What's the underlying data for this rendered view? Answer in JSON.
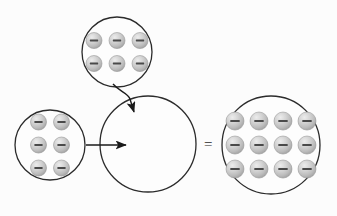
{
  "canvas": {
    "width": 337,
    "height": 216,
    "background_color": "#fcfcfc"
  },
  "style": {
    "circle_stroke_color": "#2b2b2b",
    "circle_stroke_width": 1.3,
    "circle_fill_color": "#fdfdfd",
    "arrow_color": "#1a1a1a",
    "particle_fill_light": "#e2e2e2",
    "particle_fill_mid": "#c3c3c3",
    "particle_fill_dark": "#a9a9a9",
    "particle_stroke_color": "#9a9a9a",
    "particle_sign_color": "#4a4a4a",
    "equals_color": "#2b2b2b"
  },
  "diagram": {
    "title": "",
    "equation_operator": "=",
    "particle_symbol": "−",
    "particle_name": "electron",
    "groups": [
      {
        "id": "top-group",
        "data_name": "top-particle-group",
        "label": "",
        "count": 6,
        "rows": 2,
        "cols": 3,
        "center_x": 117,
        "center_y": 52,
        "radius": 35,
        "particle_radius": 8,
        "spacing_x": 23,
        "spacing_y": 23
      },
      {
        "id": "left-group",
        "data_name": "left-particle-group",
        "label": "",
        "count": 6,
        "rows": 3,
        "cols": 2,
        "center_x": 50,
        "center_y": 145,
        "radius": 35,
        "particle_radius": 8,
        "spacing_x": 23,
        "spacing_y": 23
      },
      {
        "id": "result-group",
        "data_name": "result-particle-group",
        "label": "",
        "count": 0,
        "rows": 0,
        "cols": 0,
        "center_x": 148,
        "center_y": 144,
        "radius": 48,
        "particle_radius": 8,
        "spacing_x": 0,
        "spacing_y": 0
      },
      {
        "id": "sum-group",
        "data_name": "sum-particle-group",
        "label": "",
        "count": 12,
        "rows": 3,
        "cols": 4,
        "center_x": 271,
        "center_y": 145,
        "radius": 49,
        "particle_radius": 9,
        "spacing_x": 24,
        "spacing_y": 24
      }
    ],
    "arrows": [
      {
        "id": "left-arrow",
        "data_name": "left-to-result-arrow",
        "path": "M 86 145 L 126 145",
        "label": ""
      },
      {
        "id": "top-arrow",
        "data_name": "top-to-result-arrow",
        "path": "M 113 84 C 120 92 128 93 130 99 L 134 112",
        "label": ""
      }
    ],
    "equals": {
      "data_name": "equals-sign",
      "text": "=",
      "x": 204,
      "y": 137
    }
  }
}
